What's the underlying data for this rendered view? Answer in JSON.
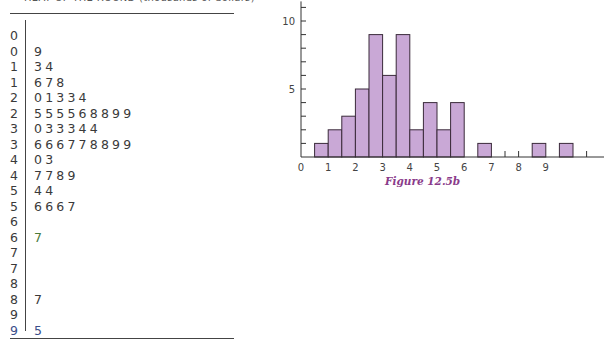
{
  "page": {
    "header_text": "HEAT OF THE ROUND (thousands of dollars)"
  },
  "stem_leaf": {
    "rows": [
      {
        "stem": "0",
        "leaves": ""
      },
      {
        "stem": "0",
        "leaves": "9"
      },
      {
        "stem": "1",
        "leaves": "34"
      },
      {
        "stem": "1",
        "leaves": "678"
      },
      {
        "stem": "2",
        "leaves": "01334"
      },
      {
        "stem": "2",
        "leaves": "555568899"
      },
      {
        "stem": "3",
        "leaves": "033344"
      },
      {
        "stem": "3",
        "leaves": "666778899"
      },
      {
        "stem": "4",
        "leaves": "03"
      },
      {
        "stem": "4",
        "leaves": "7789"
      },
      {
        "stem": "5",
        "leaves": "44"
      },
      {
        "stem": "5",
        "leaves": "6667"
      },
      {
        "stem": "6",
        "leaves": ""
      },
      {
        "stem": "6",
        "leaves": "7",
        "color": "green"
      },
      {
        "stem": "7",
        "leaves": ""
      },
      {
        "stem": "7",
        "leaves": ""
      },
      {
        "stem": "8",
        "leaves": ""
      },
      {
        "stem": "8",
        "leaves": "7"
      },
      {
        "stem": "9",
        "leaves": ""
      },
      {
        "stem": "9",
        "leaves": "5",
        "color": "blue"
      }
    ]
  },
  "figure": {
    "caption": "Figure 12.5b"
  },
  "chart_data": {
    "type": "bar",
    "title": "",
    "caption": "Figure 12.5b",
    "xlabel": "",
    "ylabel": "",
    "bin_width": 0.5,
    "bins": [
      {
        "start": 0.5,
        "end": 1.0,
        "count": 1
      },
      {
        "start": 1.0,
        "end": 1.5,
        "count": 2
      },
      {
        "start": 1.5,
        "end": 2.0,
        "count": 3
      },
      {
        "start": 2.0,
        "end": 2.5,
        "count": 5
      },
      {
        "start": 2.5,
        "end": 3.0,
        "count": 9
      },
      {
        "start": 3.0,
        "end": 3.5,
        "count": 6
      },
      {
        "start": 3.5,
        "end": 4.0,
        "count": 9
      },
      {
        "start": 4.0,
        "end": 4.5,
        "count": 2
      },
      {
        "start": 4.5,
        "end": 5.0,
        "count": 4
      },
      {
        "start": 5.0,
        "end": 5.5,
        "count": 2
      },
      {
        "start": 5.5,
        "end": 6.0,
        "count": 4
      },
      {
        "start": 6.5,
        "end": 7.0,
        "count": 1
      },
      {
        "start": 8.5,
        "end": 9.0,
        "count": 1
      },
      {
        "start": 9.5,
        "end": 10.0,
        "count": 1
      }
    ],
    "x_ticks": [
      0,
      1,
      2,
      3,
      4,
      5,
      6,
      7,
      8,
      9
    ],
    "x_minor_ticks": [
      7.5,
      8,
      10.5
    ],
    "y_ticks_labeled": [
      5,
      10
    ],
    "y_tick_step": 1,
    "xlim": [
      0,
      11
    ],
    "ylim": [
      0,
      11
    ],
    "bar_color": "#c9a8d6",
    "bar_edge_color": "#3a2a3a",
    "grid": false,
    "legend": null
  }
}
